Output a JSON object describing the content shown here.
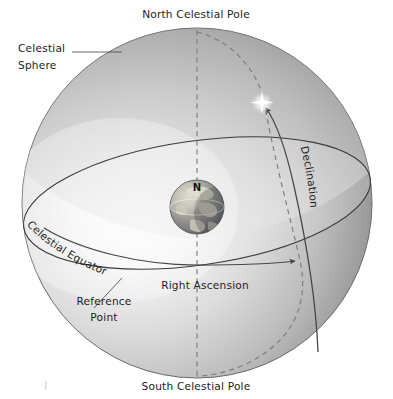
{
  "figure": {
    "background_color": "#ffffff",
    "width": 393,
    "height": 399
  },
  "labels": {
    "north_pole": "North Celestial Pole",
    "south_pole": "South Celestial Pole",
    "celestial_sphere_line1": "Celestial",
    "celestial_sphere_line2": "Sphere",
    "celestial_equator": "Celestial Equator",
    "right_ascension": "Right Ascension",
    "declination": "Declination",
    "reference_point_line1": "Reference",
    "reference_point_line2": "Point",
    "earth_north": "N"
  },
  "colors": {
    "sphere_light": "#fafafa",
    "sphere_mid": "#c9c9c9",
    "sphere_dark": "#7e7e80",
    "sphere_edge": "#6a6a6c",
    "line": "#3a3a3c",
    "dashed": "#7c7c80",
    "text": "#1d1d1d",
    "star": "#ffffff",
    "earth_land": "#b9b4a4",
    "earth_ocean": "#6e7175"
  },
  "geometry": {
    "sphere_center_x": 197,
    "sphere_center_y": 203,
    "sphere_radius": 175,
    "earth_center_x": 197,
    "earth_center_y": 207,
    "earth_radius": 27,
    "star_x": 262,
    "star_y": 103,
    "equator_tilt_degrees": -8,
    "equator_semi_minor": 62
  },
  "elements": [
    {
      "name": "celestial-sphere",
      "kind": "sphere",
      "shading": "radial-gradient light from left-center"
    },
    {
      "name": "celestial-equator",
      "kind": "ellipse",
      "style": "solid"
    },
    {
      "name": "polar-axis",
      "kind": "line",
      "style": "dashed",
      "from": "north-celestial-pole",
      "to": "south-celestial-pole"
    },
    {
      "name": "hour-circle",
      "kind": "arc",
      "style": "dashed",
      "from": "north-celestial-pole",
      "through": "star",
      "to": "south-celestial-pole"
    },
    {
      "name": "declination-arrow",
      "kind": "arrow",
      "style": "solid",
      "points_to": "star"
    },
    {
      "name": "right-ascension-arrow",
      "kind": "arrow",
      "style": "solid",
      "along": "celestial-equator"
    },
    {
      "name": "reference-point",
      "kind": "point",
      "on": "celestial-equator"
    },
    {
      "name": "earth",
      "kind": "globe"
    },
    {
      "name": "star",
      "kind": "star-glyph"
    }
  ]
}
